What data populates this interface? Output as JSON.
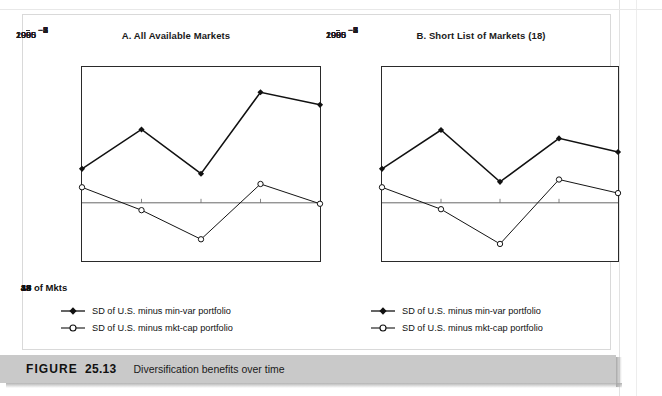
{
  "figure": {
    "caption_prefix": "FIGURE",
    "caption_number": "25.13",
    "caption_text": "Diversification benefits over time"
  },
  "legend": {
    "series1_label": "SD of U.S. minus min-var portfolio",
    "series2_label": "SD of U.S. minus mkt-cap portfolio",
    "series1_marker": "filled-diamond-icon",
    "series2_marker": "open-circle-icon"
  },
  "mkts": {
    "label": "# of Mkts",
    "values": [
      "18",
      "19",
      "33",
      "43",
      "43"
    ]
  },
  "chart_data": [
    {
      "type": "line",
      "title": "A. All Available Markets",
      "xlabel": "",
      "ylabel": "",
      "x": [
        1985,
        1990,
        1995,
        2000,
        2005
      ],
      "xtick_labels": [
        "1985",
        "1990",
        "1995",
        "2000",
        "2005"
      ],
      "ytick_labels": [
        "7",
        "6",
        "5",
        "4",
        "3",
        "2",
        "1",
        "0",
        "−1",
        "−2",
        "−3"
      ],
      "ylim": [
        -3,
        7
      ],
      "yticks": [
        -3,
        -2,
        -1,
        0,
        1,
        2,
        3,
        4,
        5,
        6,
        7
      ],
      "grid": false,
      "zero_line": true,
      "legend_position": "below",
      "series": [
        {
          "name": "SD of U.S. minus min-var portfolio",
          "marker": "filled-diamond",
          "values": [
            1.75,
            3.78,
            1.5,
            5.7,
            5.05
          ]
        },
        {
          "name": "SD of U.S. minus mkt-cap portfolio",
          "marker": "open-circle",
          "values": [
            0.8,
            -0.38,
            -1.88,
            0.97,
            -0.05
          ]
        }
      ]
    },
    {
      "type": "line",
      "title": "B. Short List of Markets (18)",
      "xlabel": "",
      "ylabel": "",
      "x": [
        1985,
        1990,
        1995,
        2000,
        2005
      ],
      "xtick_labels": [
        "1985",
        "1990",
        "1995",
        "2000",
        "2005"
      ],
      "ytick_labels": [
        "7",
        "6",
        "5",
        "4",
        "3",
        "2",
        "1",
        "0",
        "−1",
        "−2",
        "−3"
      ],
      "ylim": [
        -3,
        7
      ],
      "yticks": [
        -3,
        -2,
        -1,
        0,
        1,
        2,
        3,
        4,
        5,
        6,
        7
      ],
      "grid": false,
      "zero_line": true,
      "legend_position": "below",
      "series": [
        {
          "name": "SD of U.S. minus min-var portfolio",
          "marker": "filled-diamond",
          "values": [
            1.75,
            3.75,
            1.08,
            3.32,
            2.62
          ]
        },
        {
          "name": "SD of U.S. minus mkt-cap portfolio",
          "marker": "open-circle",
          "values": [
            0.8,
            -0.33,
            -2.12,
            1.2,
            0.5
          ]
        }
      ]
    }
  ]
}
